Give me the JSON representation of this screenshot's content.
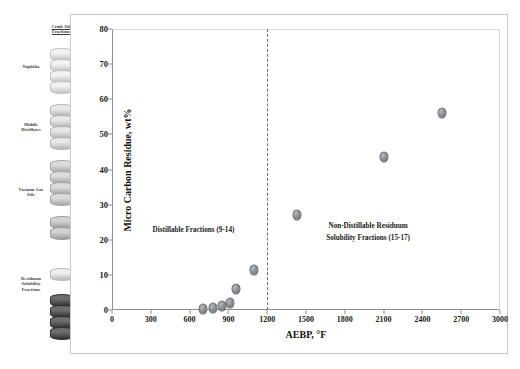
{
  "sidebar": {
    "stack_title_line1": "Crude Oil",
    "stack_title_line2": "Fractions",
    "items": [
      {
        "label": "Naphtha"
      },
      {
        "label": "Middle Distillates"
      },
      {
        "label": "Vacuum Gas Oils"
      },
      {
        "label": "Residuum Solubility Fractions"
      }
    ]
  },
  "chart_data": {
    "type": "scatter",
    "title": "",
    "xlabel": "AEBP, °F",
    "ylabel": "Micro Carbon Residue, wt%",
    "xlim": [
      0,
      3000
    ],
    "ylim": [
      0,
      80
    ],
    "xticks": [
      0,
      300,
      600,
      900,
      1200,
      1500,
      1800,
      2100,
      2400,
      2700,
      3000
    ],
    "yticks": [
      0,
      10,
      20,
      30,
      40,
      50,
      60,
      70,
      80
    ],
    "grid": false,
    "legend": "none",
    "marker_color": "#8a8f95",
    "marker_edge_color": "#5d6268",
    "series": [
      {
        "name": "Micro Carbon Residue",
        "points": [
          {
            "x": 700,
            "y": 0.3
          },
          {
            "x": 780,
            "y": 0.5
          },
          {
            "x": 850,
            "y": 1.0
          },
          {
            "x": 915,
            "y": 2.0
          },
          {
            "x": 960,
            "y": 6.0
          },
          {
            "x": 1100,
            "y": 11.5
          },
          {
            "x": 1430,
            "y": 27.0
          },
          {
            "x": 2100,
            "y": 43.5
          },
          {
            "x": 2550,
            "y": 56.0
          }
        ]
      }
    ],
    "annotations": [
      {
        "name": "distillable-label",
        "text": "Distillable Fractions (9-14)",
        "x": 630,
        "y": 22.5
      },
      {
        "name": "non-distillable-label-line1",
        "text": "Non-Distillable Residuum",
        "x": 1980,
        "y": 23.5
      },
      {
        "name": "non-distillable-label-line2",
        "text": "Solubility Fractions (15-17)",
        "x": 1980,
        "y": 20.2
      }
    ],
    "reference_lines": [
      {
        "name": "distillation-cutoff",
        "orientation": "vertical",
        "x": 1200,
        "style": "dashed",
        "color": "#6e6e6e"
      }
    ]
  }
}
